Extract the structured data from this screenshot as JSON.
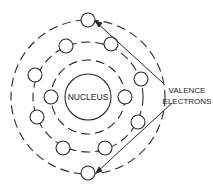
{
  "diagram": {
    "nucleus_label": "NUCLEUS",
    "callout_label_line1": "VALENCE",
    "callout_label_line2": "ELECTRONS",
    "colors": {
      "line": "#2a2a2a",
      "background": "#ffffff"
    },
    "shells": [
      {
        "name": "inner-shell",
        "electrons": 2
      },
      {
        "name": "middle-shell",
        "electrons": 8
      },
      {
        "name": "outer-shell",
        "electrons": 2,
        "valence": true
      }
    ]
  }
}
